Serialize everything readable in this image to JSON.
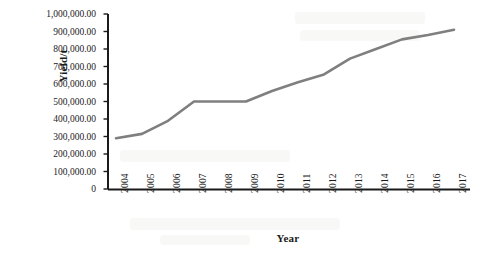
{
  "chart_data": {
    "type": "line",
    "title": "",
    "xlabel": "Year",
    "ylabel": "Yield/t",
    "categories": [
      "2004",
      "2005",
      "2006",
      "2007",
      "2008",
      "2009",
      "2010",
      "2011",
      "2012",
      "2013",
      "2014",
      "2015",
      "2016",
      "2017"
    ],
    "values": [
      290000,
      315000,
      390000,
      500000,
      500000,
      500000,
      560000,
      610000,
      655000,
      745000,
      800000,
      855000,
      880000,
      910000
    ],
    "series": [
      {
        "name": "Yield",
        "values": [
          290000,
          315000,
          390000,
          500000,
          500000,
          500000,
          560000,
          610000,
          655000,
          745000,
          800000,
          855000,
          880000,
          910000
        ]
      }
    ],
    "ylim": [
      0,
      1000000
    ],
    "ytick_labels": [
      "1,000,000.00",
      "900,000.00",
      "800,000.00",
      "700,000.00",
      "600,000.00",
      "500,000.00",
      "400,000.00",
      "300,000.00",
      "200,000.00",
      "100,000.00",
      "0"
    ],
    "ytick_values": [
      1000000,
      900000,
      800000,
      700000,
      600000,
      500000,
      400000,
      300000,
      200000,
      100000,
      0
    ],
    "grid": false,
    "legend": false,
    "legend_position": "none",
    "line_color": "#7f7f7f",
    "axis_color": "#1a1a1a",
    "background_color": "#ffffff"
  }
}
